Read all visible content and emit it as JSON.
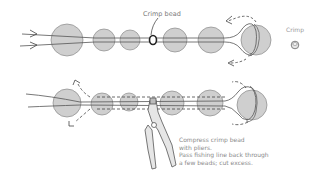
{
  "diagram": {
    "labels": {
      "crimp_bead": "Crimp bead",
      "crimp": "Crimp"
    },
    "instructions": [
      "Compress crimp bead",
      "with pliers.",
      "Pass fishing line back through",
      "a few beads; cut excess."
    ],
    "colors": {
      "bead_fill": "#cfcfcf",
      "line": "#555555",
      "crimp_bead": "#222222",
      "background": "#ffffff"
    },
    "top_row": {
      "beads": [
        {
          "cx": 67,
          "cy": 40,
          "r": 16
        },
        {
          "cx": 104,
          "cy": 40,
          "r": 11
        },
        {
          "cx": 130,
          "cy": 40,
          "r": 10
        },
        {
          "cx": 175,
          "cy": 40,
          "r": 12
        },
        {
          "cx": 211,
          "cy": 40,
          "r": 13
        },
        {
          "cx": 256,
          "cy": 40,
          "r": 15
        }
      ],
      "crimp_bead": {
        "cx": 153,
        "cy": 40
      }
    },
    "bottom_row": {
      "beads": [
        {
          "cx": 67,
          "cy": 103,
          "r": 14
        },
        {
          "cx": 102,
          "cy": 104,
          "r": 11
        },
        {
          "cx": 129,
          "cy": 102,
          "r": 9
        },
        {
          "cx": 172,
          "cy": 103,
          "r": 12
        },
        {
          "cx": 210,
          "cy": 103,
          "r": 13
        },
        {
          "cx": 252,
          "cy": 105,
          "r": 15
        }
      ]
    }
  }
}
